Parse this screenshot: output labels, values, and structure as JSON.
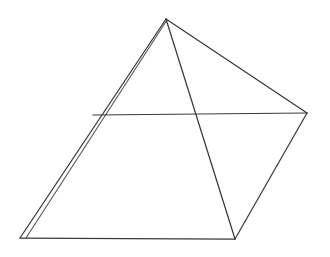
{
  "figure": {
    "type": "wireframe-line-drawing",
    "shape_name": "square-based pyramid",
    "canvas": {
      "width": 330,
      "height": 257,
      "background": "#ffffff"
    },
    "stroke": {
      "primary_color": "#3a3a3a",
      "secondary_color": "#555555",
      "tertiary_color": "#6a6a6a",
      "width": 1.25
    },
    "vertices": [
      {
        "id": "apex",
        "label": "Apex",
        "x": 166,
        "y": 19
      },
      {
        "id": "base-left",
        "label": "Base Left",
        "x": 20,
        "y": 238
      },
      {
        "id": "base-front",
        "label": "Base Front",
        "x": 235,
        "y": 239
      },
      {
        "id": "base-right",
        "label": "Base Right",
        "x": 307,
        "y": 113
      },
      {
        "id": "base-back",
        "label": "Base Back",
        "x": 93,
        "y": 115
      }
    ],
    "edges": [
      {
        "id": "apex-to-base-left",
        "label": "Apex to Base Left",
        "path": "M 166 19 L 20 238",
        "style": "primary"
      },
      {
        "id": "apex-to-base-left-2",
        "label": "Apex to Base Left (dup)",
        "path": "M 167 20 L 26 238",
        "style": "secondary"
      },
      {
        "id": "apex-to-base-front",
        "label": "Apex to Base Front",
        "path": "M 166 19 L 235 239",
        "style": "primary"
      },
      {
        "id": "apex-to-base-right",
        "label": "Apex to Base Right",
        "path": "M 166 19 L 307 113",
        "style": "primary"
      },
      {
        "id": "base-left-to-front",
        "label": "Base Left to Base Front",
        "path": "M 20 238 L 235 239",
        "style": "primary"
      },
      {
        "id": "base-front-to-right",
        "label": "Base Front to Base Right",
        "path": "M 235 239 L 307 113",
        "style": "primary"
      },
      {
        "id": "base-back-to-right",
        "label": "Base Back to Base Right",
        "path": "M 93 115 L 307 113",
        "style": "primary"
      }
    ],
    "intersections": [
      {
        "id": "mid-cross",
        "label": "Horizontal meets front ridge",
        "x": 197,
        "y": 113
      }
    ]
  }
}
